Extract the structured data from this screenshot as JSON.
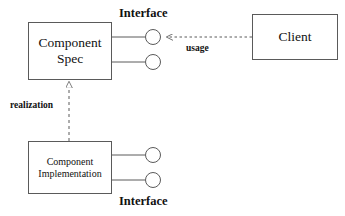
{
  "diagram": {
    "type": "uml-component-diagram",
    "width": 345,
    "height": 216,
    "background_color": "#ffffff",
    "stroke_color": "#5a5a5a",
    "text_color": "#111111",
    "nodes": {
      "component_spec": {
        "label": "Component\nSpec",
        "shape": "rectangle"
      },
      "client": {
        "label": "Client",
        "shape": "rectangle"
      },
      "component_implementation": {
        "label": "Component\nImplementation",
        "shape": "rectangle"
      }
    },
    "interface_labels": {
      "top": "Interface",
      "bottom": "Interface"
    },
    "edges": {
      "usage": {
        "label": "usage",
        "style": "dashed",
        "arrowhead": "open",
        "from": "Client",
        "to": "Interface"
      },
      "realization": {
        "label": "realization",
        "style": "dashed",
        "arrowhead": "hollow-triangle",
        "from": "Component Implementation",
        "to": "Component Spec"
      }
    },
    "lollipops": {
      "spec_top": "provided-interface",
      "spec_bottom": "provided-interface",
      "impl_top": "provided-interface",
      "impl_bottom": "provided-interface"
    }
  }
}
